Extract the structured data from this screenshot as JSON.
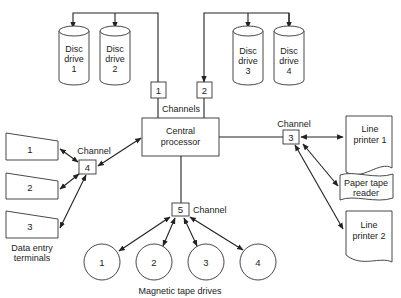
{
  "diagram": {
    "central_processor": {
      "line1": "Central",
      "line2": "processor"
    },
    "channels_label": "Channels",
    "channel_label": "Channel",
    "channels": [
      {
        "id": "1"
      },
      {
        "id": "2"
      },
      {
        "id": "3"
      },
      {
        "id": "4"
      },
      {
        "id": "5"
      }
    ],
    "disc_drives": [
      {
        "line1": "Disc",
        "line2": "drive",
        "num": "1"
      },
      {
        "line1": "Disc",
        "line2": "drive",
        "num": "2"
      },
      {
        "line1": "Disc",
        "line2": "drive",
        "num": "3"
      },
      {
        "line1": "Disc",
        "line2": "drive",
        "num": "4"
      }
    ],
    "terminals": {
      "items": [
        {
          "num": "1"
        },
        {
          "num": "2"
        },
        {
          "num": "3"
        }
      ],
      "caption_line1": "Data entry",
      "caption_line2": "terminals"
    },
    "tape_drives": {
      "items": [
        {
          "num": "1"
        },
        {
          "num": "2"
        },
        {
          "num": "3"
        },
        {
          "num": "4"
        }
      ],
      "caption": "Magnetic tape drives"
    },
    "line_printer_1": {
      "line1": "Line",
      "line2": "printer 1"
    },
    "paper_tape_reader": {
      "line1": "Paper tape",
      "line2": "reader"
    },
    "line_printer_2": {
      "line1": "Line",
      "line2": "printer 2"
    }
  }
}
